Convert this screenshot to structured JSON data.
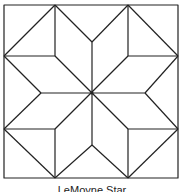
{
  "title": "LeMoyne Star",
  "diagram": {
    "stroke_color": "#222222",
    "background": "#ffffff",
    "square": {
      "x1": 4,
      "y1": 5,
      "x2": 178,
      "y2": 178
    },
    "center": {
      "x": 92,
      "y": 93
    },
    "caption": "LeMoyne Star"
  }
}
